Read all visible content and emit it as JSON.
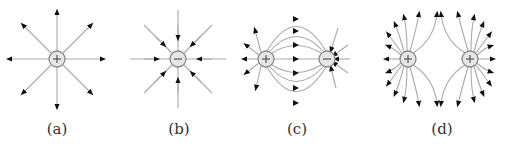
{
  "figure": {
    "panels": [
      {
        "id": "a",
        "label": "(a)",
        "description": "Isolated positive charge, field lines radiating outward",
        "charges": [
          "+"
        ]
      },
      {
        "id": "b",
        "label": "(b)",
        "description": "Isolated negative charge, field lines pointing inward",
        "charges": [
          "−"
        ]
      },
      {
        "id": "c",
        "label": "(c)",
        "description": "Electric dipole: positive and negative charge, lines from + to −",
        "charges": [
          "+",
          "−"
        ]
      },
      {
        "id": "d",
        "label": "(d)",
        "description": "Two equal positive charges, field lines repel",
        "charges": [
          "+",
          "+"
        ]
      }
    ],
    "colors": {
      "field_line": "#aaaaaa",
      "arrow": "#111111",
      "charge_fill": "#e6e6e6",
      "charge_stroke": "#888888"
    }
  }
}
